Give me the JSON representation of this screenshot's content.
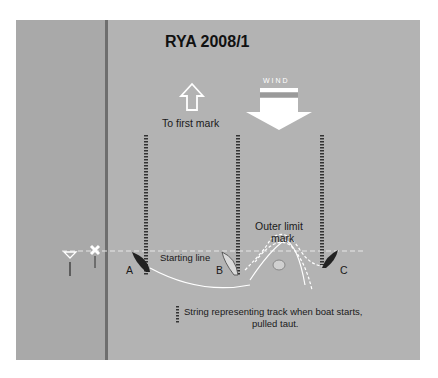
{
  "title": "RYA 2008/1",
  "wind_label": "WIND",
  "first_mark_label": "To first mark",
  "outer_limit_label_line1": "Outer limit",
  "outer_limit_label_line2": "mark",
  "starting_line_label": "Starting line",
  "boats": [
    {
      "id": "A",
      "label": "A",
      "color": "#222222"
    },
    {
      "id": "B",
      "label": "B",
      "color": "#d9d9d9"
    },
    {
      "id": "C",
      "label": "C",
      "color": "#222222"
    }
  ],
  "legend": {
    "line1": "String representing track when boat starts,",
    "line2": "pulled taut."
  },
  "colors": {
    "panel": "#b3b3b3",
    "strip": "#a9a9a9",
    "divider": "#6e6e6e",
    "track": "#ffffff"
  }
}
